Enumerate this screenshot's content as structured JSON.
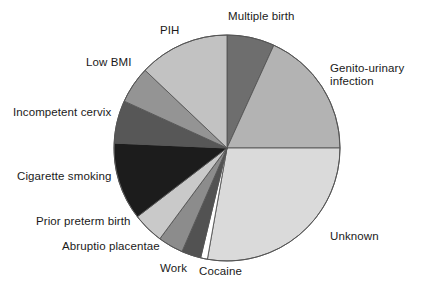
{
  "chart_data": {
    "type": "pie",
    "title": "",
    "subtitle": "",
    "xlabel": "",
    "ylabel": "",
    "legend_position": "none",
    "grid": false,
    "start_angle_deg": 0,
    "direction": "clockwise",
    "center": {
      "x": 227,
      "y": 148
    },
    "radius": 113,
    "outline_color": "#555555",
    "labels": [
      "Multiple birth",
      "Genito-urinary infection",
      "Unknown",
      "Cocaine",
      "Work",
      "Abruptio placentae",
      "Prior preterm birth",
      "Cigarette smoking",
      "Incompetent cervix",
      "Low BMI",
      "PIH"
    ],
    "values": [
      6.8,
      18.2,
      27.8,
      1.0,
      2.8,
      3.6,
      4.4,
      11.1,
      6.1,
      5.3,
      12.9
    ],
    "slices": [
      {
        "name": "Multiple birth",
        "label": "Multiple birth",
        "percent": 6.8,
        "start_deg": 0,
        "end_deg": 24.5,
        "color": "#6e6e6e",
        "label_position": "top"
      },
      {
        "name": "Genito-urinary infection",
        "label": "Genito-urinary infection",
        "label_line_1": "Genito-urinary",
        "label_line_2": "infection",
        "percent": 18.2,
        "start_deg": 24.5,
        "end_deg": 90,
        "color": "#b3b3b3",
        "label_position": "right"
      },
      {
        "name": "Unknown",
        "label": "Unknown",
        "percent": 27.8,
        "start_deg": 90,
        "end_deg": 190,
        "color": "#dadada",
        "label_position": "bottom-right"
      },
      {
        "name": "Cocaine",
        "label": "Cocaine",
        "percent": 1.0,
        "start_deg": 190,
        "end_deg": 193.5,
        "color": "#ffffff",
        "label_position": "bottom"
      },
      {
        "name": "Work",
        "label": "Work",
        "percent": 2.8,
        "start_deg": 193.5,
        "end_deg": 203.5,
        "color": "#525252",
        "label_position": "bottom"
      },
      {
        "name": "Abruptio placentae",
        "label": "Abruptio placentae",
        "percent": 3.6,
        "start_deg": 203.5,
        "end_deg": 216.5,
        "color": "#8c8c8c",
        "label_position": "bottom-left"
      },
      {
        "name": "Prior preterm birth",
        "label": "Prior preterm birth",
        "percent": 4.4,
        "start_deg": 216.5,
        "end_deg": 232.5,
        "color": "#c9c9c9",
        "label_position": "left"
      },
      {
        "name": "Cigarette smoking",
        "label": "Cigarette smoking",
        "percent": 11.1,
        "start_deg": 232.5,
        "end_deg": 272.5,
        "color": "#1c1c1c",
        "label_position": "left"
      },
      {
        "name": "Incompetent cervix",
        "label": "Incompetent cervix",
        "percent": 6.1,
        "start_deg": 272.5,
        "end_deg": 294.5,
        "color": "#575757",
        "label_position": "left"
      },
      {
        "name": "Low BMI",
        "label": "Low BMI",
        "percent": 5.3,
        "start_deg": 294.5,
        "end_deg": 313.5,
        "color": "#949494",
        "label_position": "top-left"
      },
      {
        "name": "PIH",
        "label": "PIH",
        "percent": 12.9,
        "start_deg": 313.5,
        "end_deg": 360,
        "color": "#c2c2c2",
        "label_position": "top-left"
      }
    ],
    "annotations": []
  },
  "figure": {
    "background": "#ffffff"
  }
}
